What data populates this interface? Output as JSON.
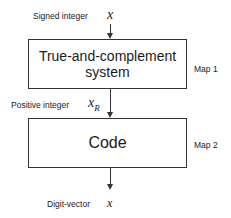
{
  "diagram": {
    "input": {
      "label": "Signed integer",
      "symbol": "x"
    },
    "box1": {
      "line1": "True-and-complement",
      "line2": "system",
      "map_label": "Map 1"
    },
    "intermediate": {
      "label": "Positive integer",
      "symbol": "x",
      "subscript": "R"
    },
    "box2": {
      "text": "Code",
      "map_label": "Map 2"
    },
    "output": {
      "label": "Digit-vector",
      "symbol": "x"
    }
  }
}
